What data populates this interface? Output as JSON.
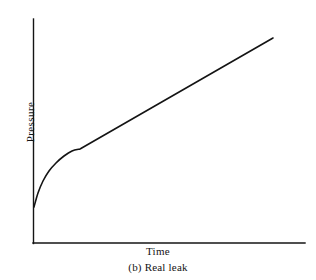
{
  "figure": {
    "caption": "(b) Real leak",
    "background_color": "#ffffff",
    "ink_color": "#141414"
  },
  "chart_data": {
    "type": "line",
    "title": "",
    "subtitle": "",
    "caption": "(b) Real leak",
    "xlabel": "Time",
    "ylabel": "Pressure",
    "xlim": [
      0,
      1
    ],
    "ylim": [
      0,
      1
    ],
    "grid": false,
    "legend": null,
    "axis_ticks": {
      "x": [],
      "y": []
    },
    "axes": {
      "x_axis_drawn": true,
      "y_axis_drawn": true,
      "origin_px": [
        33,
        243
      ],
      "x_axis_end_px": [
        305,
        243
      ],
      "y_axis_top_px": [
        33,
        19
      ],
      "line_color": "#141414",
      "line_width_px": 1.4
    },
    "series": [
      {
        "name": "Real leak pressure rise",
        "color": "#141414",
        "line_width_px": 1.6,
        "description": "Steep concave-down virtual-leak transient that bends into a constant-slope linear rise characteristic of a real leak",
        "points_px": [
          [
            34,
            207
          ],
          [
            38,
            193
          ],
          [
            43,
            181
          ],
          [
            49,
            171
          ],
          [
            56,
            163
          ],
          [
            64,
            156
          ],
          [
            72,
            151
          ],
          [
            80,
            149
          ],
          [
            96,
            140
          ],
          [
            112,
            131
          ],
          [
            128,
            122
          ],
          [
            144,
            113
          ],
          [
            160,
            104
          ],
          [
            176,
            95
          ],
          [
            192,
            86
          ],
          [
            208,
            77
          ],
          [
            224,
            68
          ],
          [
            240,
            58
          ],
          [
            256,
            48
          ],
          [
            273,
            38
          ]
        ],
        "normalized_points": [
          [
            0.004,
            0.161
          ],
          [
            0.018,
            0.223
          ],
          [
            0.037,
            0.277
          ],
          [
            0.059,
            0.321
          ],
          [
            0.085,
            0.357
          ],
          [
            0.114,
            0.388
          ],
          [
            0.143,
            0.411
          ],
          [
            0.173,
            0.42
          ],
          [
            0.232,
            0.46
          ],
          [
            0.29,
            0.5
          ],
          [
            0.349,
            0.54
          ],
          [
            0.408,
            0.58
          ],
          [
            0.467,
            0.62
          ],
          [
            0.526,
            0.661
          ],
          [
            0.585,
            0.701
          ],
          [
            0.643,
            0.741
          ],
          [
            0.702,
            0.781
          ],
          [
            0.761,
            0.826
          ],
          [
            0.82,
            0.871
          ],
          [
            0.882,
            0.915
          ]
        ],
        "knee_px": [
          80,
          149
        ],
        "start_px": [
          34,
          207
        ],
        "end_px": [
          273,
          38
        ]
      }
    ]
  },
  "labels": {
    "y_axis": "Pressure",
    "x_axis": "Time",
    "caption": "(b) Real leak"
  }
}
